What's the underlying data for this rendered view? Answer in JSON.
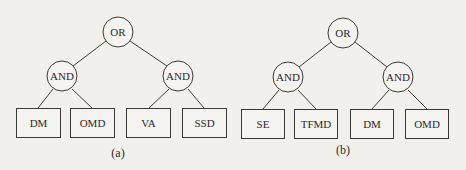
{
  "diagrams": [
    {
      "caption": "(a)",
      "root": {
        "label": "OR",
        "shape": "circle"
      },
      "gates": [
        {
          "label": "AND",
          "shape": "circle",
          "children": [
            "DM",
            "OMD"
          ]
        },
        {
          "label": "AND",
          "shape": "circle",
          "children": [
            "VA",
            "SSD"
          ]
        }
      ],
      "leaves": [
        "DM",
        "OMD",
        "VA",
        "SSD"
      ]
    },
    {
      "caption": "(b)",
      "root": {
        "label": "OR",
        "shape": "circle"
      },
      "gates": [
        {
          "label": "AND",
          "shape": "circle",
          "children": [
            "SE",
            "TFMD"
          ]
        },
        {
          "label": "AND",
          "shape": "circle",
          "children": [
            "DM",
            "OMD"
          ]
        }
      ],
      "leaves": [
        "SE",
        "TFMD",
        "DM",
        "OMD"
      ]
    }
  ],
  "colors": {
    "background": "#f1f0ec",
    "stroke": "#3a3a3a",
    "text": "#2a2a2a"
  }
}
